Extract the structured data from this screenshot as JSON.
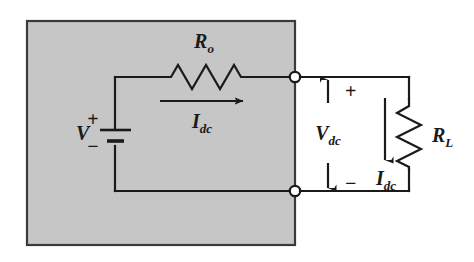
{
  "figure": {
    "type": "circuit-schematic",
    "background_color": "#ffffff",
    "shaded_box_color": "#c6c6c6",
    "line_color": "#1a1a1a"
  },
  "labels": {
    "source_voltage": {
      "symbol": "V",
      "subscript": ""
    },
    "output_resistor": {
      "symbol": "R",
      "subscript": "o"
    },
    "source_current": {
      "symbol": "I",
      "subscript": "dc"
    },
    "terminal_voltage": {
      "symbol": "V",
      "subscript": "dc"
    },
    "load_resistor": {
      "symbol": "R",
      "subscript": "L"
    },
    "load_current": {
      "symbol": "I",
      "subscript": "dc"
    },
    "battery_plus": "+",
    "battery_minus": "−",
    "terminal_plus": "+",
    "terminal_minus": "−"
  },
  "icons": {
    "battery": "battery-symbol-icon",
    "resistor_horizontal": "resistor-zigzag-horizontal-icon",
    "resistor_vertical": "resistor-zigzag-vertical-icon",
    "terminal_top": "open-terminal-node-icon",
    "terminal_bottom": "open-terminal-node-icon",
    "current_arrow_source": "arrow-right-icon",
    "current_arrow_load": "arrow-down-icon",
    "voltage_arrow_up": "arrow-up-icon",
    "voltage_arrow_down": "arrow-down-icon"
  }
}
